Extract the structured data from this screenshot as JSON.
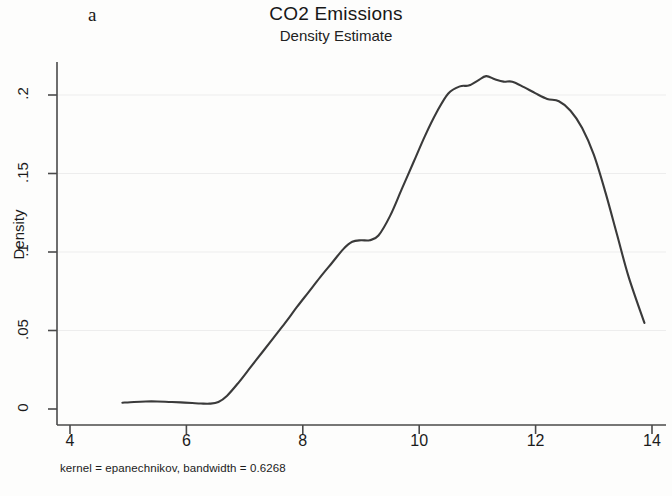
{
  "figure": {
    "panel_letter": "a",
    "title": "CO2 Emissions",
    "subtitle": "Density Estimate",
    "footnote": "kernel = epanechnikov, bandwidth = 0.6268",
    "line_color": "#3a3a3a",
    "axis_color": "#4a4a4a",
    "grid_color": "#ededed",
    "background": "#fdfdfc"
  },
  "chart_data": {
    "type": "line",
    "title": "CO2 Emissions",
    "subtitle": "Density Estimate",
    "xlabel": "",
    "ylabel": "Density",
    "xlim": [
      4,
      14
    ],
    "ylim": [
      0,
      0.22
    ],
    "xticks": [
      4,
      6,
      8,
      10,
      12,
      14
    ],
    "xtick_labels": [
      "4",
      "6",
      "8",
      "10",
      "12",
      "14"
    ],
    "yticks": [
      0,
      0.05,
      0.1,
      0.15,
      0.2
    ],
    "ytick_labels": [
      "0",
      ".05",
      ".1",
      ".15",
      ".2"
    ],
    "grid": "faint-horizontal",
    "legend": null,
    "annotation": "kernel = epanechnikov, bandwidth = 0.6268",
    "series": [
      {
        "name": "Density Estimate",
        "x": [
          4.9,
          5.1,
          5.3,
          5.5,
          5.7,
          5.9,
          6.1,
          6.25,
          6.4,
          6.55,
          6.7,
          6.9,
          7.1,
          7.3,
          7.5,
          7.7,
          7.9,
          8.1,
          8.3,
          8.5,
          8.7,
          8.85,
          9.0,
          9.15,
          9.3,
          9.5,
          9.7,
          9.9,
          10.1,
          10.3,
          10.5,
          10.7,
          10.85,
          11.0,
          11.15,
          11.3,
          11.45,
          11.6,
          11.8,
          12.0,
          12.2,
          12.4,
          12.6,
          12.8,
          13.0,
          13.2,
          13.4,
          13.6,
          13.87
        ],
        "y": [
          0.004,
          0.0045,
          0.0048,
          0.0048,
          0.0045,
          0.0042,
          0.0038,
          0.0035,
          0.0034,
          0.0045,
          0.0085,
          0.017,
          0.0265,
          0.036,
          0.0455,
          0.055,
          0.065,
          0.0745,
          0.084,
          0.093,
          0.102,
          0.1065,
          0.1075,
          0.1075,
          0.1105,
          0.123,
          0.14,
          0.157,
          0.174,
          0.189,
          0.201,
          0.2055,
          0.206,
          0.209,
          0.212,
          0.21,
          0.2085,
          0.2085,
          0.205,
          0.201,
          0.1975,
          0.196,
          0.19,
          0.179,
          0.162,
          0.138,
          0.111,
          0.084,
          0.0548
        ]
      }
    ]
  },
  "axis_labels": {
    "y_title": "Density"
  }
}
